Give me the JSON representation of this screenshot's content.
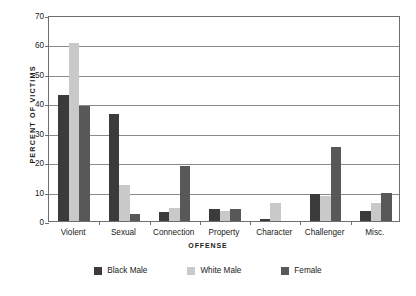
{
  "chart_data": {
    "type": "bar",
    "title": "",
    "xlabel": "OFFENSE",
    "ylabel": "PERCENT OF VICTIMS",
    "ylim": [
      0,
      70
    ],
    "ytick_step": 10,
    "yticks": [
      0,
      10,
      20,
      30,
      40,
      50,
      60,
      70
    ],
    "grid": true,
    "legend_position": "bottom",
    "categories": [
      "Violent",
      "Sexual",
      "Connection",
      "Property",
      "Character",
      "Challenger",
      "Misc."
    ],
    "series": [
      {
        "name": "Black Male",
        "color": "#3b3b3b",
        "values": [
          42.8,
          36.2,
          3.2,
          4.0,
          0.7,
          9.2,
          3.5
        ]
      },
      {
        "name": "White Male",
        "color": "#c9c9c9",
        "values": [
          60.5,
          12.3,
          4.5,
          3.5,
          6.2,
          8.6,
          6.0
        ]
      },
      {
        "name": "Female",
        "color": "#585858",
        "values": [
          39.0,
          2.3,
          18.8,
          4.0,
          0.0,
          25.0,
          9.6
        ]
      }
    ]
  },
  "axis": {
    "y_title": "PERCENT OF VICTIMS",
    "x_title": "OFFENSE",
    "y_tick_labels": [
      "70",
      "60",
      "50",
      "40",
      "30",
      "20",
      "10",
      "0"
    ],
    "x_tick_labels": [
      "Violent",
      "Sexual",
      "Connection",
      "Property",
      "Character",
      "Challenger",
      "Misc."
    ]
  },
  "legend": {
    "items": [
      {
        "label": "Black Male",
        "color": "#3b3b3b"
      },
      {
        "label": "White Male",
        "color": "#c9c9c9"
      },
      {
        "label": "Female",
        "color": "#585858"
      }
    ]
  },
  "colors": {
    "background": "#ffffff",
    "axis": "#6e6e6e",
    "gridline": "#8a8a8a",
    "text": "#1a1a1a",
    "black_male": "#3b3b3b",
    "white_male": "#c9c9c9",
    "female": "#585858"
  }
}
